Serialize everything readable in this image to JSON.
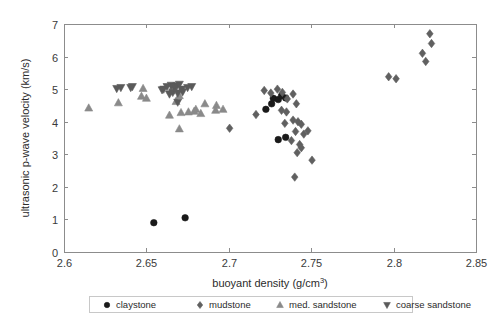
{
  "chart_data": {
    "type": "scatter",
    "title": "",
    "xlabel": "buoyant density (g/cm3)",
    "ylabel": "ultrasonic p-wave velocity (km/s)",
    "xlim": [
      2.6,
      2.85
    ],
    "ylim": [
      0,
      7
    ],
    "xticks": [
      "2.6",
      "2.65",
      "2.7",
      "2.75",
      "2.8",
      "2.85"
    ],
    "xtick_values": [
      2.6,
      2.65,
      2.7,
      2.75,
      2.8,
      2.85
    ],
    "yticks": [
      "0",
      "1",
      "2",
      "3",
      "4",
      "5",
      "6",
      "7"
    ],
    "ytick_values": [
      0,
      1,
      2,
      3,
      4,
      5,
      6,
      7
    ],
    "grid": false,
    "legend_position": "below-axes",
    "series": [
      {
        "name": "claystone",
        "marker": "circle",
        "color": "#1a1a1a",
        "points": [
          [
            2.6545,
            0.9
          ],
          [
            2.6735,
            1.05
          ],
          [
            2.727,
            4.72
          ],
          [
            2.73,
            4.68
          ],
          [
            2.732,
            4.8
          ],
          [
            2.7345,
            4.73
          ],
          [
            2.726,
            4.55
          ],
          [
            2.73,
            3.45
          ],
          [
            2.7345,
            3.52
          ],
          [
            2.7225,
            4.38
          ]
        ]
      },
      {
        "name": "mudstone",
        "marker": "diamond",
        "color": "#606060",
        "points": [
          [
            2.7165,
            4.22
          ],
          [
            2.7215,
            4.96
          ],
          [
            2.7255,
            4.88
          ],
          [
            2.7295,
            5.0
          ],
          [
            2.7325,
            4.9
          ],
          [
            2.7355,
            4.7
          ],
          [
            2.739,
            4.85
          ],
          [
            2.741,
            4.55
          ],
          [
            2.732,
            4.35
          ],
          [
            2.735,
            4.3
          ],
          [
            2.739,
            4.05
          ],
          [
            2.742,
            4.0
          ],
          [
            2.744,
            3.92
          ],
          [
            2.7405,
            3.7
          ],
          [
            2.7455,
            3.62
          ],
          [
            2.743,
            3.3
          ],
          [
            2.744,
            3.2
          ],
          [
            2.7415,
            3.05
          ],
          [
            2.738,
            3.42
          ],
          [
            2.734,
            3.95
          ],
          [
            2.748,
            3.72
          ],
          [
            2.7505,
            2.82
          ],
          [
            2.74,
            2.3
          ],
          [
            2.7005,
            3.8
          ],
          [
            2.797,
            5.38
          ],
          [
            2.8015,
            5.32
          ],
          [
            2.8175,
            6.1
          ],
          [
            2.8195,
            5.85
          ],
          [
            2.822,
            6.7
          ],
          [
            2.823,
            6.4
          ]
        ]
      },
      {
        "name": "med. sandstone",
        "marker": "triangle-up",
        "color": "#8a8a8a",
        "points": [
          [
            2.615,
            4.42
          ],
          [
            2.633,
            4.58
          ],
          [
            2.647,
            4.78
          ],
          [
            2.648,
            5.02
          ],
          [
            2.65,
            4.72
          ],
          [
            2.665,
            4.95
          ],
          [
            2.666,
            5.05
          ],
          [
            2.67,
            4.8
          ],
          [
            2.668,
            4.62
          ],
          [
            2.6855,
            4.55
          ],
          [
            2.6925,
            4.5
          ],
          [
            2.679,
            4.32
          ],
          [
            2.68,
            4.38
          ],
          [
            2.6755,
            4.3
          ],
          [
            2.671,
            4.28
          ],
          [
            2.664,
            4.2
          ],
          [
            2.67,
            3.78
          ],
          [
            2.692,
            4.35
          ],
          [
            2.6965,
            4.38
          ],
          [
            2.683,
            4.25
          ]
        ]
      },
      {
        "name": "coarse sandstone",
        "marker": "triangle-down",
        "color": "#5a5a5a",
        "points": [
          [
            2.632,
            5.02
          ],
          [
            2.6345,
            5.05
          ],
          [
            2.6405,
            5.05
          ],
          [
            2.6415,
            5.08
          ],
          [
            2.6605,
            5.0
          ],
          [
            2.6625,
            5.08
          ],
          [
            2.665,
            5.12
          ],
          [
            2.667,
            5.05
          ],
          [
            2.6685,
            5.1
          ],
          [
            2.67,
            5.15
          ],
          [
            2.6715,
            5.0
          ],
          [
            2.666,
            4.9
          ],
          [
            2.669,
            4.88
          ],
          [
            2.672,
            4.92
          ],
          [
            2.664,
            4.85
          ],
          [
            2.675,
            5.05
          ],
          [
            2.6775,
            5.08
          ],
          [
            2.669,
            4.6
          ],
          [
            2.6595,
            4.98
          ]
        ]
      }
    ]
  },
  "legend": {
    "entries": [
      {
        "label": "claystone",
        "marker": "circle"
      },
      {
        "label": "mudstone",
        "marker": "diamond"
      },
      {
        "label": "med. sandstone",
        "marker": "triangle-up"
      },
      {
        "label": "coarse sandstone",
        "marker": "triangle-down"
      }
    ]
  },
  "axis_labels": {
    "x_main": "buoyant density (g/cm",
    "x_sup": "3",
    "x_close": ")",
    "y": "ultrasonic p-wave velocity (km/s)"
  }
}
